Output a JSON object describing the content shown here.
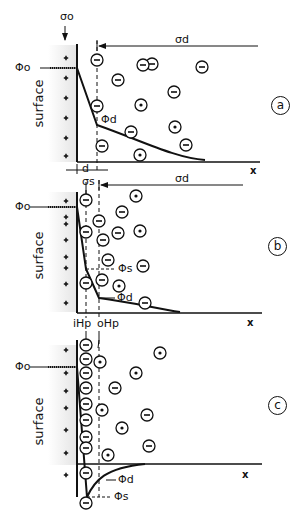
{
  "figure": {
    "top_label": "σo",
    "panels": [
      {
        "id": "a",
        "tag": "a",
        "surface_label": "surface",
        "phi0_label": "Φo",
        "phid_label": "Φd",
        "sigma_d_label": "σd",
        "x_axis_label": "x",
        "d_label": "d",
        "layers": [
          "diffuse layer starting at distance d"
        ]
      },
      {
        "id": "b",
        "tag": "b",
        "surface_label": "surface",
        "phi0_label": "Φo",
        "phis_label": "Φs",
        "phid_label": "Φd",
        "sigma_s_label": "σs",
        "sigma_d_label": "σd",
        "x_axis_label": "x",
        "ihp_label": "iHp",
        "ohp_label": "oHp"
      },
      {
        "id": "c",
        "tag": "c",
        "surface_label": "surface",
        "phi0_label": "Φo",
        "phid_label": "Φd",
        "phis_label": "Φs",
        "x_axis_label": "x"
      }
    ],
    "colors": {
      "ink": "#111111",
      "surface_fill": "#ececec"
    }
  }
}
